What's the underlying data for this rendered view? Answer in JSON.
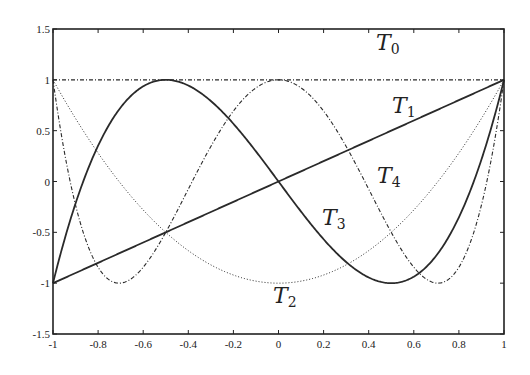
{
  "chart_data": {
    "type": "line",
    "title": "",
    "xlabel": "",
    "ylabel": "",
    "xlim": [
      -1,
      1
    ],
    "ylim": [
      -1.5,
      1.5
    ],
    "grid": false,
    "legend": "none (inline curve labels)",
    "x_ticks": [
      -1,
      -0.8,
      -0.6,
      -0.4,
      -0.2,
      0,
      0.2,
      0.4,
      0.6,
      0.8,
      1
    ],
    "x_tick_labels": [
      "-1",
      "-0.8",
      "-0.6",
      "-0.4",
      "-0.2",
      "0",
      "0.2",
      "0.4",
      "0.6",
      "0.8",
      "1"
    ],
    "y_ticks": [
      -1.5,
      -1,
      -0.5,
      0,
      0.5,
      1,
      1.5
    ],
    "y_tick_labels": [
      "-1.5",
      "-1",
      "-0.5",
      "0",
      "0.5",
      "1",
      "1.5"
    ],
    "series": [
      {
        "name": "T0",
        "label_main": "T",
        "label_sub": "0",
        "formula": "1",
        "style": "dashdot",
        "width": 1.2,
        "degree": 0,
        "x": [
          -1,
          -0.5,
          0,
          0.5,
          1
        ],
        "values": [
          1,
          1,
          1,
          1,
          1
        ],
        "label_pos": [
          376,
          50
        ]
      },
      {
        "name": "T1",
        "label_main": "T",
        "label_sub": "1",
        "formula": "x",
        "style": "solid",
        "width": 1.8,
        "degree": 1,
        "x": [
          -1,
          -0.5,
          0,
          0.5,
          1
        ],
        "values": [
          -1,
          -0.5,
          0,
          0.5,
          1
        ],
        "label_pos": [
          392,
          113
        ]
      },
      {
        "name": "T2",
        "label_main": "T",
        "label_sub": "2",
        "formula": "2x^2-1",
        "style": "dotted",
        "width": 1.0,
        "degree": 2,
        "x": [
          -1,
          -0.5,
          0,
          0.5,
          1
        ],
        "values": [
          1,
          -0.5,
          -1,
          -0.5,
          1
        ],
        "label_pos": [
          273,
          303
        ]
      },
      {
        "name": "T3",
        "label_main": "T",
        "label_sub": "3",
        "formula": "4x^3-3x",
        "style": "solid",
        "width": 1.8,
        "degree": 3,
        "x": [
          -1,
          -0.5,
          0,
          0.5,
          1
        ],
        "values": [
          -1,
          1,
          0,
          -1,
          1
        ],
        "label_pos": [
          322,
          225
        ]
      },
      {
        "name": "T4",
        "label_main": "T",
        "label_sub": "4",
        "formula": "8x^4-8x^2+1",
        "style": "dashdot",
        "width": 1.1,
        "degree": 4,
        "x": [
          -1,
          -0.7071,
          0,
          0.7071,
          1
        ],
        "values": [
          1,
          -1,
          1,
          -1,
          1
        ],
        "label_pos": [
          377,
          183
        ]
      }
    ]
  },
  "plot_area": {
    "left": 53,
    "right": 504,
    "top": 29,
    "bottom": 334
  },
  "colors": {
    "axis": "#222222",
    "curve": "#2a2a2a",
    "background": "#ffffff"
  }
}
